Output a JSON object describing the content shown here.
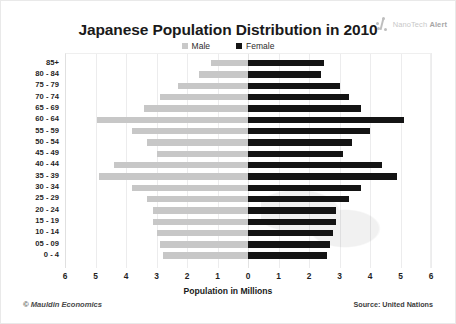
{
  "header": {
    "title": "Japanese Population Distribution in 2010",
    "brand_prefix": "NanoTech ",
    "brand_suffix": "Alert"
  },
  "legend": {
    "male_label": "Male",
    "female_label": "Female",
    "male_color": "#c7c7c7",
    "female_color": "#141414"
  },
  "footer": {
    "copyright": "© Mauldin Economics",
    "source": "Source: United Nations"
  },
  "chart_data": {
    "type": "bar",
    "subtype": "population-pyramid",
    "title": "Japanese Population Distribution in 2010",
    "xlabel": "Population in Millions",
    "ylabel": "",
    "grid": true,
    "legend_position": "top-center",
    "xlim": [
      -6,
      6
    ],
    "xticks": [
      -6,
      -5,
      -4,
      -3,
      -2,
      -1,
      0,
      1,
      2,
      3,
      4,
      5,
      6
    ],
    "xticklabels": [
      "6",
      "5",
      "4",
      "3",
      "2",
      "1",
      "0",
      "1",
      "2",
      "3",
      "4",
      "5",
      "6"
    ],
    "categories": [
      "85+",
      "80 - 84",
      "75 - 79",
      "70 - 74",
      "65 - 69",
      "60 - 64",
      "55 - 59",
      "50 - 54",
      "45 - 49",
      "40 - 44",
      "35 - 39",
      "30 - 34",
      "25 - 29",
      "20 - 24",
      "15 - 19",
      "10 - 14",
      "05 - 09",
      "0 - 4"
    ],
    "series": [
      {
        "name": "Male",
        "color": "#c7c7c7",
        "side": "left",
        "values": [
          1.2,
          1.6,
          2.3,
          2.9,
          3.4,
          4.95,
          3.8,
          3.3,
          3.0,
          4.4,
          4.9,
          3.8,
          3.3,
          3.1,
          3.1,
          3.0,
          2.9,
          2.8
        ]
      },
      {
        "name": "Female",
        "color": "#141414",
        "side": "right",
        "values": [
          2.5,
          2.4,
          3.0,
          3.3,
          3.7,
          5.1,
          4.0,
          3.4,
          3.1,
          4.4,
          4.9,
          3.7,
          3.3,
          2.9,
          2.9,
          2.8,
          2.7,
          2.6
        ]
      }
    ]
  }
}
